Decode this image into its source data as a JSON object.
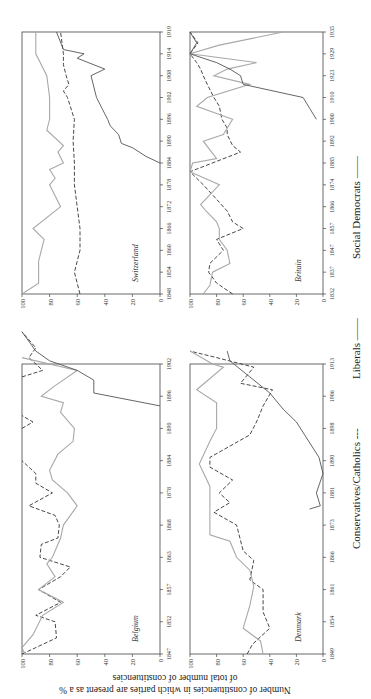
{
  "chart_data": [
    {
      "type": "line",
      "title": "Belgium",
      "xlabel": "",
      "ylabel": "Number of constituencies in which parties are present as a % of total number of constituencies",
      "ylim": [
        0,
        100
      ],
      "yticks": [
        0,
        20,
        40,
        60,
        80,
        100
      ],
      "x_tick_labels": [
        "1847",
        "1852",
        "1857",
        "1863",
        "1868",
        "1878",
        "1884",
        "1890",
        "1896",
        "1902"
      ],
      "series": [
        {
          "name": "Conservatives/Catholics",
          "style": "dashed",
          "points": [
            [
              0,
              100
            ],
            [
              0.2,
              90
            ],
            [
              0.5,
              75
            ],
            [
              1,
              76
            ],
            [
              1.2,
              90
            ],
            [
              1.6,
              72
            ],
            [
              2,
              88
            ],
            [
              2.4,
              72
            ],
            [
              2.7,
              65
            ],
            [
              3,
              87
            ],
            [
              3.4,
              86
            ],
            [
              3.6,
              74
            ],
            [
              4,
              73
            ],
            [
              4.3,
              76
            ],
            [
              4.6,
              95
            ],
            [
              5,
              78
            ],
            [
              5.3,
              90
            ],
            [
              5.6,
              90
            ],
            [
              6,
              100
            ],
            null,
            [
              7,
              100
            ],
            [
              7.2,
              92
            ],
            [
              7.4,
              100
            ],
            null,
            [
              8.6,
              100
            ],
            [
              8.8,
              85
            ],
            [
              9.2,
              95
            ],
            [
              9.5,
              90
            ],
            [
              10,
              100
            ]
          ]
        },
        {
          "name": "Liberals",
          "style": "gray",
          "points": [
            [
              0,
              98
            ],
            [
              0.2,
              100
            ],
            [
              0.6,
              92
            ],
            [
              1.2,
              85
            ],
            [
              1.6,
              70
            ],
            [
              2,
              88
            ],
            [
              2.4,
              76
            ],
            [
              2.8,
              82
            ],
            [
              3,
              78
            ],
            [
              3.6,
              72
            ],
            [
              4,
              70
            ],
            [
              4.6,
              60
            ],
            [
              5,
              67
            ],
            [
              5.4,
              78
            ],
            [
              5.7,
              80
            ],
            [
              6.2,
              74
            ],
            [
              6.6,
              63
            ],
            [
              7,
              62
            ],
            [
              7.5,
              72
            ],
            [
              7.8,
              70
            ],
            [
              8,
              86
            ],
            [
              8.3,
              77
            ],
            [
              8.8,
              60
            ],
            [
              9.2,
              100
            ]
          ]
        },
        {
          "name": "Social Democrats",
          "style": "solid",
          "points": [
            [
              7.7,
              0
            ],
            [
              8.1,
              48
            ],
            [
              8.5,
              48
            ],
            [
              8.8,
              60
            ],
            [
              9.1,
              80
            ],
            [
              9.4,
              90
            ],
            [
              10,
              100
            ]
          ]
        }
      ]
    },
    {
      "type": "line",
      "title": "Switzerland",
      "ylim": [
        0,
        100
      ],
      "yticks": [
        0,
        20,
        40,
        60,
        80,
        100
      ],
      "x_tick_labels": [
        "1848",
        "1854",
        "1860",
        "1866",
        "1872",
        "1878",
        "1884",
        "1890",
        "1896",
        "1902",
        "1908",
        "1914",
        "1919"
      ],
      "series": [
        {
          "name": "Conservatives/Catholics",
          "style": "dashed",
          "points": [
            [
              0,
              58
            ],
            [
              0.5,
              60
            ],
            [
              1,
              62
            ],
            [
              1.5,
              60
            ],
            [
              2,
              58
            ],
            [
              3,
              58
            ],
            [
              4,
              60
            ],
            [
              5,
              62
            ],
            [
              6,
              62
            ],
            [
              7,
              63
            ],
            [
              8,
              62
            ],
            [
              9,
              67
            ],
            [
              9.3,
              70
            ],
            [
              9.6,
              66
            ],
            [
              10,
              68
            ],
            [
              10.5,
              70
            ],
            [
              11,
              70
            ],
            [
              12,
              72
            ]
          ]
        },
        {
          "name": "Liberals",
          "style": "gray",
          "points": [
            [
              0,
              100
            ],
            [
              0.5,
              88
            ],
            [
              1.5,
              88
            ],
            [
              2.5,
              84
            ],
            [
              3,
              92
            ],
            [
              4,
              72
            ],
            [
              4.5,
              76
            ],
            [
              5,
              80
            ],
            [
              5.3,
              76
            ],
            [
              5.7,
              80
            ],
            [
              6,
              70
            ],
            [
              6.5,
              74
            ],
            [
              6.8,
              70
            ],
            [
              7.5,
              82
            ],
            [
              8,
              80
            ],
            [
              9,
              80
            ],
            [
              10,
              82
            ],
            [
              10.5,
              86
            ],
            [
              11,
              90
            ],
            [
              12,
              90
            ]
          ]
        },
        {
          "name": "Social Democrats",
          "style": "solid",
          "points": [
            [
              6,
              0
            ],
            [
              6.3,
              10
            ],
            [
              6.7,
              20
            ],
            [
              6.9,
              28
            ],
            [
              7.3,
              30
            ],
            [
              7.7,
              36
            ],
            [
              8,
              38
            ],
            [
              8.5,
              42
            ],
            [
              9,
              46
            ],
            [
              10,
              50
            ],
            [
              10.3,
              40
            ],
            [
              10.8,
              60
            ],
            [
              11,
              55
            ],
            [
              11.2,
              70
            ],
            [
              12,
              75
            ]
          ]
        }
      ]
    },
    {
      "type": "line",
      "title": "Denmark",
      "ylim": [
        0,
        100
      ],
      "yticks": [
        0,
        20,
        40,
        60,
        80,
        100
      ],
      "x_tick_labels": [
        "1849",
        "1854",
        "1861",
        "1866",
        "1873",
        "1881",
        "1890",
        "1898",
        "1906",
        "1913"
      ],
      "series": [
        {
          "name": "Conservatives/Catholics",
          "style": "dashed",
          "points": [
            [
              0,
              57
            ],
            [
              0.3,
              53
            ],
            [
              0.8,
              40
            ],
            [
              1.3,
              45
            ],
            [
              2,
              45
            ],
            [
              2.3,
              55
            ],
            [
              2.9,
              52
            ],
            [
              3.2,
              60
            ],
            [
              4,
              65
            ],
            [
              4.4,
              82
            ],
            [
              4.7,
              70
            ],
            [
              5,
              78
            ],
            [
              5.4,
              68
            ],
            [
              5.8,
              85
            ],
            [
              6.1,
              85
            ],
            [
              6.8,
              55
            ],
            [
              7.2,
              50
            ],
            [
              7.7,
              45
            ],
            [
              8.2,
              38
            ],
            [
              8.4,
              62
            ],
            [
              8.9,
              52
            ],
            [
              9.2,
              80
            ],
            [
              9.4,
              100
            ]
          ]
        },
        {
          "name": "Liberals",
          "style": "gray",
          "points": [
            [
              0,
              45
            ],
            [
              0.4,
              47
            ],
            [
              0.8,
              60
            ],
            [
              1.5,
              55
            ],
            [
              2.1,
              52
            ],
            [
              2.6,
              55
            ],
            [
              3,
              65
            ],
            [
              3.5,
              70
            ],
            [
              3.7,
              85
            ],
            [
              4.3,
              85
            ],
            [
              5.2,
              85
            ],
            [
              5.9,
              93
            ],
            [
              6.6,
              85
            ],
            [
              7,
              80
            ],
            [
              7.8,
              80
            ],
            [
              8.2,
              95
            ],
            [
              8.9,
              75
            ],
            [
              9,
              83
            ],
            [
              9.4,
              100
            ]
          ]
        },
        {
          "name": "Social Democrats",
          "style": "solid",
          "points": [
            [
              4.5,
              10
            ],
            [
              4.6,
              2
            ],
            [
              5,
              5
            ],
            [
              5.6,
              0
            ],
            [
              6.1,
              3
            ],
            [
              7.2,
              20
            ],
            [
              7.6,
              30
            ],
            [
              8.1,
              40
            ],
            [
              8.6,
              55
            ],
            [
              9.1,
              70
            ],
            [
              9.4,
              72
            ]
          ]
        }
      ]
    },
    {
      "type": "line",
      "title": "Britain",
      "ylim": [
        0,
        100
      ],
      "yticks": [
        0,
        20,
        40,
        60,
        80,
        100
      ],
      "x_tick_labels": [
        "1832",
        "1837",
        "1847",
        "1857",
        "1866",
        "1874",
        "1885",
        "1892",
        "1900",
        "1910",
        "1923",
        "1929",
        "1935"
      ],
      "series": [
        {
          "name": "Conservatives/Catholics",
          "style": "dashed",
          "points": [
            [
              0,
              68
            ],
            [
              0.5,
              80
            ],
            [
              1,
              86
            ],
            [
              1.4,
              85
            ],
            [
              2,
              75
            ],
            [
              2.5,
              80
            ],
            [
              3,
              60
            ],
            [
              3.3,
              68
            ],
            [
              3.8,
              72
            ],
            [
              4.2,
              78
            ],
            [
              5,
              90
            ],
            [
              5.6,
              100
            ],
            [
              6.5,
              62
            ],
            [
              6.8,
              68
            ],
            [
              7.3,
              72
            ],
            [
              7.6,
              72
            ],
            [
              8,
              76
            ],
            [
              8.6,
              78
            ],
            [
              9,
              82
            ],
            [
              9.6,
              87
            ],
            [
              10,
              90
            ],
            [
              10.3,
              92
            ],
            [
              10.6,
              95
            ],
            [
              11,
              100
            ],
            [
              11.5,
              94
            ],
            [
              12,
              100
            ]
          ]
        },
        {
          "name": "Liberals",
          "style": "gray",
          "points": [
            [
              0,
              90
            ],
            [
              0.4,
              85
            ],
            [
              1,
              83
            ],
            [
              1.4,
              70
            ],
            [
              2,
              72
            ],
            [
              2.5,
              78
            ],
            [
              3,
              78
            ],
            [
              3.3,
              80
            ],
            [
              3.8,
              88
            ],
            [
              4.1,
              92
            ],
            [
              5,
              78
            ],
            [
              5.6,
              100
            ],
            [
              6,
              98
            ],
            [
              6.2,
              80
            ],
            [
              7,
              90
            ],
            [
              7.3,
              75
            ],
            [
              8,
              68
            ],
            [
              8.6,
              95
            ],
            [
              9,
              87
            ],
            [
              9.6,
              55
            ],
            [
              10,
              82
            ],
            [
              10.3,
              72
            ],
            [
              10.6,
              50
            ],
            [
              11,
              100
            ],
            [
              11.4,
              78
            ],
            [
              12,
              30
            ]
          ]
        },
        {
          "name": "Social Democrats",
          "style": "solid",
          "points": [
            [
              8,
              5
            ],
            [
              8.5,
              10
            ],
            [
              9,
              15
            ],
            [
              9.6,
              60
            ],
            [
              10,
              62
            ],
            [
              10.3,
              70
            ],
            [
              10.6,
              80
            ],
            [
              11,
              100
            ],
            [
              11.5,
              95
            ],
            [
              12,
              100
            ]
          ]
        }
      ]
    }
  ],
  "labels": {
    "ylabel_line1": "Number of constituencies in which parties are present as a %",
    "ylabel_line2": "of total number of constituencies",
    "legend": {
      "conservatives": "Conservatives/Catholics ---",
      "liberals": "Liberals ——",
      "social_democrats": "Social Democrats ——"
    }
  },
  "colors": {
    "conservatives": "#333333",
    "liberals": "#a8a8a8",
    "social_democrats": "#555555",
    "axis": "#444444"
  }
}
